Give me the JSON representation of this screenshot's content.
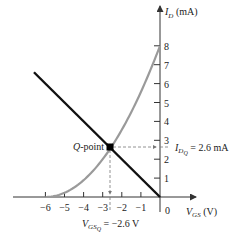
{
  "chart_data": {
    "type": "line",
    "title": "",
    "xlabel": "V_GS (V)",
    "ylabel": "I_D (mA)",
    "xlim": [
      -6.6,
      0.5
    ],
    "ylim": [
      0,
      8.6
    ],
    "grid": false,
    "legend": null,
    "x_ticks": [
      -6,
      -5,
      -4,
      -3,
      -2,
      -1,
      0
    ],
    "x_tick_labels": [
      "−6",
      "−5",
      "−4",
      "−3",
      "−2",
      "−1",
      "0"
    ],
    "y_ticks": [
      1,
      2,
      3,
      4,
      5,
      6,
      7,
      8
    ],
    "y_tick_labels": [
      "1",
      "2",
      "3",
      "4",
      "5",
      "6",
      "7",
      "8"
    ],
    "series": [
      {
        "name": "Transfer characteristic",
        "type": "curve",
        "color": "#9a9a9a",
        "equation": "I_D = 8(1 + V_GS/6)^2",
        "I_DSS": 8,
        "V_P": -6,
        "x": [
          -6,
          -5,
          -4,
          -3,
          -2.6,
          -2,
          -1,
          0
        ],
        "y": [
          0,
          0.22,
          0.89,
          2.0,
          2.57,
          3.56,
          5.56,
          8.0
        ]
      },
      {
        "name": "Self-bias line",
        "type": "line",
        "color": "#111111",
        "equation": "I_D = -V_GS",
        "x": [
          -6.6,
          0
        ],
        "y": [
          6.6,
          0
        ]
      }
    ],
    "annotations": [
      {
        "text": "Q-point",
        "x": -2.6,
        "y": 2.6
      },
      {
        "text": "I_DQ = 2.6 mA",
        "value": 2.6,
        "axis": "y"
      },
      {
        "text": "V_GSQ = −2.6 V",
        "value": -2.6,
        "axis": "x"
      }
    ]
  },
  "labels": {
    "y_axis_main": "I",
    "y_axis_sub": "D",
    "y_axis_unit": " (mA)",
    "x_axis_main": "V",
    "x_axis_sub": "GS",
    "x_axis_unit": " (V)",
    "q_point_italic": "Q",
    "q_point_rest": "-point",
    "idq_main": "I",
    "idq_sub": "D",
    "idq_subsub": "Q",
    "idq_value": " = 2.6 mA",
    "vgsq_main": "V",
    "vgsq_sub": "GS",
    "vgsq_subsub": "Q",
    "vgsq_value": " = −2.6 V",
    "origin": "0"
  },
  "colors": {
    "curve": "#9a9a9a",
    "bias_line": "#111111",
    "axes": "#333333",
    "dashed": "#777777"
  }
}
